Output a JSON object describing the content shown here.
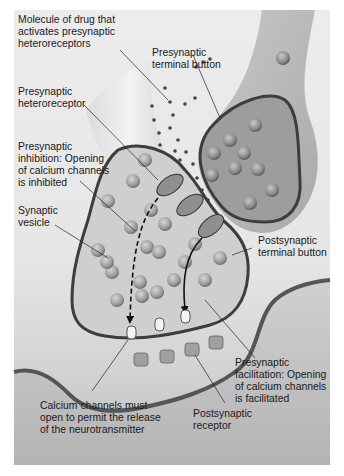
{
  "diagram": {
    "type": "synapse-presynaptic-modulation",
    "labels": {
      "drug_molecule": "Molecule of drug that\nactivates presynaptic\nheteroreceptors",
      "presynaptic_terminal": "Presynaptic\nterminal button",
      "heteroreceptor": "Presynaptic\nheteroreceptor",
      "inhibition": "Presynaptic\ninhibition: Opening\nof calcium channels\nis inhibited",
      "vesicle": "Synaptic\nvesicle",
      "postsynaptic_terminal": "Postsynaptic\nterminal button",
      "facilitation": "Presynaptic\nfacilitation: Opening\nof calcium channels\nis facilitated",
      "calcium_channels": "Calcium channels must\nopen to permit the release\nof the neurotransmitter",
      "postsynaptic_receptor": "Postsynaptic\nreceptor"
    },
    "colors": {
      "background": "#e8e8e8",
      "membrane": "#4a4a4a",
      "terminal_fill": "#bdbdbd",
      "vesicle": "#9a9a9a",
      "receptor": "#8c8c8c"
    }
  }
}
